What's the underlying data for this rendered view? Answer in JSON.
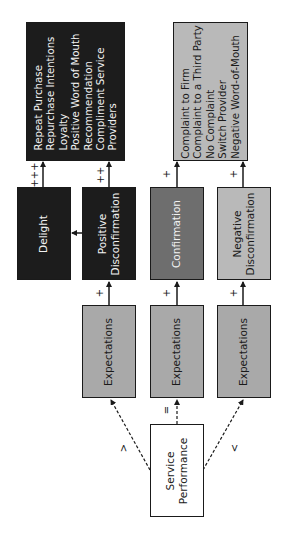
{
  "diagram": {
    "orientation": "rotated 90deg counter-clockwise",
    "source_node": {
      "label_line1": "Service",
      "label_line2": "Performance"
    },
    "comparison_signs": {
      "greater": ">",
      "equal": "=",
      "less": "<"
    },
    "expectations": [
      {
        "label": "Expectations"
      },
      {
        "label": "Expectations"
      },
      {
        "label": "Expectations"
      }
    ],
    "disconfirmation": {
      "delight": {
        "label": "Delight"
      },
      "positive": {
        "label_line1": "Positive",
        "label_line2": "Disconfirmation"
      },
      "confirmation": {
        "label": "Confirmation"
      },
      "negative": {
        "label_line1": "Negative",
        "label_line2": "Disconfirmation"
      }
    },
    "arrow_signs": {
      "exp_to_positive": "+",
      "exp_to_confirmation": "+",
      "exp_to_negative": "+",
      "delight_to_outcome": "+++",
      "positive_to_outcome": "++",
      "confirmation_to_outcome": "+",
      "negative_to_outcome": "+"
    },
    "positive_outcomes": {
      "items": [
        "Repeat Purchase",
        "Repurchase Intentions",
        "Loyalty",
        "Positive Word of Mouth",
        "Recommendation",
        "Compliment Service",
        "Providers"
      ]
    },
    "negative_outcomes": {
      "items": [
        "Complaint to Firm",
        "Complaint to a Third Party",
        "No Complaint",
        "Switch Provider",
        "Negative Word-of-Mouth"
      ]
    },
    "colors": {
      "dark_fill": "#1c1c1c",
      "mid_fill": "#6e6e6e",
      "light_fill": "#b9b9b9",
      "white_fill": "#ffffff",
      "stroke": "#1a1a1a"
    }
  }
}
